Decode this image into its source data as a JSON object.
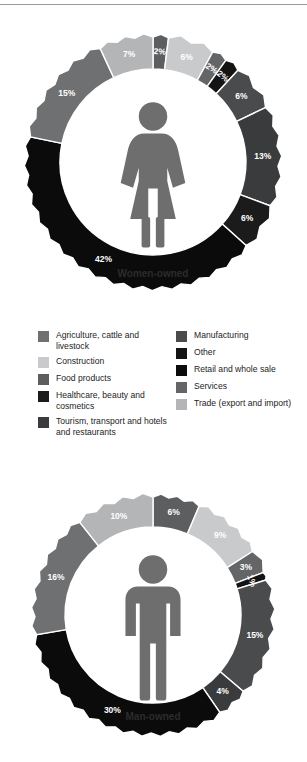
{
  "figure": {
    "background": "#ffffff",
    "rule_color": "#9a9a9a"
  },
  "legend": {
    "left_column": [
      {
        "label": "Agriculture, cattle and livestock",
        "color": "#6f7072",
        "key": "agriculture"
      },
      {
        "label": "Construction",
        "color": "#c9cacc",
        "key": "construction"
      },
      {
        "label": "Food products",
        "color": "#5d5e60",
        "key": "food"
      },
      {
        "label": "Healthcare, beauty and cosmetics",
        "color": "#1b1b1c",
        "key": "healthcare"
      },
      {
        "label": "Tourism, transport and hotels and restaurants",
        "color": "#3a3b3d",
        "key": "tourism"
      }
    ],
    "right_column": [
      {
        "label": "Manufacturing",
        "color": "#4a4b4d",
        "key": "manufacturing"
      },
      {
        "label": "Other",
        "color": "#141415",
        "key": "other"
      },
      {
        "label": "Retail and whole sale",
        "color": "#0b0b0c",
        "key": "retail"
      },
      {
        "label": "Services",
        "color": "#646567",
        "key": "services"
      },
      {
        "label": "Trade (export and import)",
        "color": "#b4b5b7",
        "key": "trade"
      }
    ]
  },
  "chart_data": [
    {
      "type": "pie",
      "title": "Women-owned",
      "center_label": "Women-owned",
      "icon": "woman-figure-icon",
      "donut": true,
      "start_angle_deg": -90,
      "categories": [
        "Food products",
        "Construction",
        "Services",
        "Other",
        "Manufacturing",
        "Tourism, transport and hotels and restaurants",
        "Healthcare, beauty and cosmetics",
        "Retail and whole sale",
        "Agriculture, cattle and livestock",
        "Trade (export and import)"
      ],
      "values": [
        2,
        6,
        2,
        2,
        6,
        13,
        6,
        42,
        15,
        7
      ],
      "labels": [
        "2%",
        "6%",
        "2%",
        "2%",
        "6%",
        "13%",
        "6%",
        "42%",
        "15%",
        "7%"
      ],
      "colors": [
        "#5d5e60",
        "#c9cacc",
        "#646567",
        "#141415",
        "#4a4b4d",
        "#3a3b3d",
        "#1b1b1c",
        "#0b0b0c",
        "#6f7072",
        "#b4b5b7"
      ]
    },
    {
      "type": "pie",
      "title": "Man-owned",
      "center_label": "Man-owned",
      "icon": "man-figure-icon",
      "donut": true,
      "start_angle_deg": -90,
      "categories": [
        "Food products",
        "Construction",
        "Services",
        "Other",
        "Manufacturing",
        "Tourism, transport and hotels and restaurants",
        "Retail and whole sale",
        "Agriculture, cattle and livestock",
        "Trade (export and import)"
      ],
      "values": [
        6,
        9,
        3,
        1,
        15,
        4,
        30,
        16,
        10
      ],
      "labels": [
        "6%",
        "9%",
        "3%",
        "1%",
        "15%",
        "4%",
        "30%",
        "16%",
        "10%"
      ],
      "colors": [
        "#5d5e60",
        "#c9cacc",
        "#646567",
        "#141415",
        "#4a4b4d",
        "#3a3b3d",
        "#0b0b0c",
        "#6f7072",
        "#b4b5b7"
      ]
    }
  ]
}
